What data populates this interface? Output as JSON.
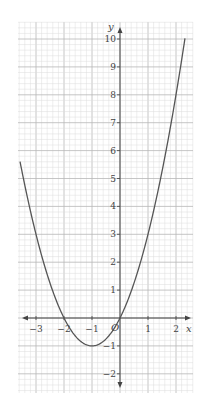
{
  "chart_data": {
    "type": "line",
    "title": "",
    "function": "y = x^2 + 2x",
    "xlabel": "x",
    "ylabel": "y",
    "xlim": [
      -3.6,
      2.35
    ],
    "ylim": [
      -2.5,
      10.5
    ],
    "grid": true,
    "x_ticks": [
      -3,
      -2,
      -1,
      0,
      1,
      2
    ],
    "y_ticks": [
      -2,
      -1,
      1,
      2,
      3,
      4,
      5,
      6,
      7,
      8,
      9,
      10
    ],
    "origin_label": "O",
    "series": [
      {
        "name": "y = x^2 + 2x",
        "x": [
          -3.57,
          -3,
          -2.5,
          -2,
          -1.5,
          -1,
          -0.5,
          0,
          0.5,
          1,
          1.5,
          2,
          2.32
        ],
        "y": [
          5.6,
          3,
          1.25,
          0,
          -0.75,
          -1,
          -0.75,
          0,
          1.25,
          3,
          5.25,
          8,
          10
        ]
      }
    ],
    "annotations": {
      "roots": [
        -2,
        0
      ],
      "vertex": [
        -1,
        -1
      ]
    }
  },
  "labels": {
    "x_axis": "x",
    "y_axis": "y",
    "origin": "O",
    "x_ticks": [
      "−3",
      "−2",
      "−1",
      "1",
      "2"
    ],
    "y_ticks": [
      "10",
      "9",
      "8",
      "7",
      "6",
      "5",
      "4",
      "3",
      "2",
      "1",
      "−1",
      "−2"
    ]
  }
}
